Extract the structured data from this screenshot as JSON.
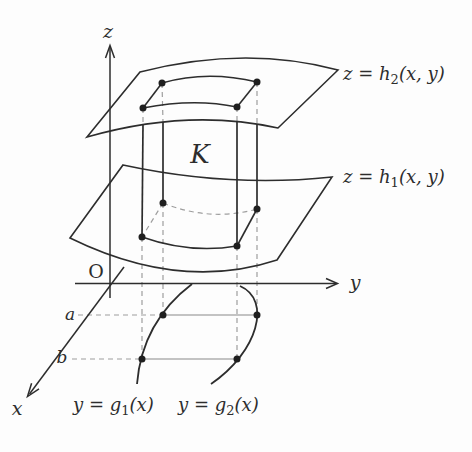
{
  "figure": {
    "colors": {
      "ink": "#2d2d2d",
      "dashed_line": "#9e9e9e",
      "thin_line": "#8a8a8a",
      "background": "#fdfdfd"
    },
    "labels": {
      "z_axis": "z",
      "y_axis": "y",
      "x_axis": "x",
      "origin": "O",
      "region": "K",
      "a_level": "a",
      "b_level": "b",
      "upper_surface": {
        "pre": "z = h",
        "sub": "2",
        "post": "(x, y)"
      },
      "lower_surface": {
        "pre": "z = h",
        "sub": "1",
        "post": "(x, y)"
      },
      "left_curve": {
        "pre": "y = g",
        "sub": "1",
        "post": "(x)"
      },
      "right_curve": {
        "pre": "y = g",
        "sub": "2",
        "post": "(x)"
      }
    }
  }
}
